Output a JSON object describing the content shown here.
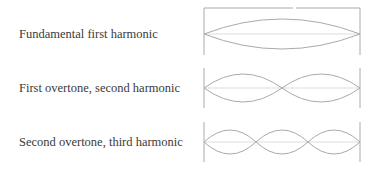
{
  "labels": [
    "Fundamental first harmonic",
    "First overtone, second harmonic",
    "Second overtone, third harmonic"
  ],
  "colors": {
    "wave": "#aaaaaa",
    "axis": "#dddddd",
    "frame": "#aaaaaa",
    "text": "#3a3a3a"
  },
  "rows": [
    {
      "harmonic": 1,
      "loops": 1
    },
    {
      "harmonic": 2,
      "loops": 2
    },
    {
      "harmonic": 3,
      "loops": 3
    }
  ]
}
